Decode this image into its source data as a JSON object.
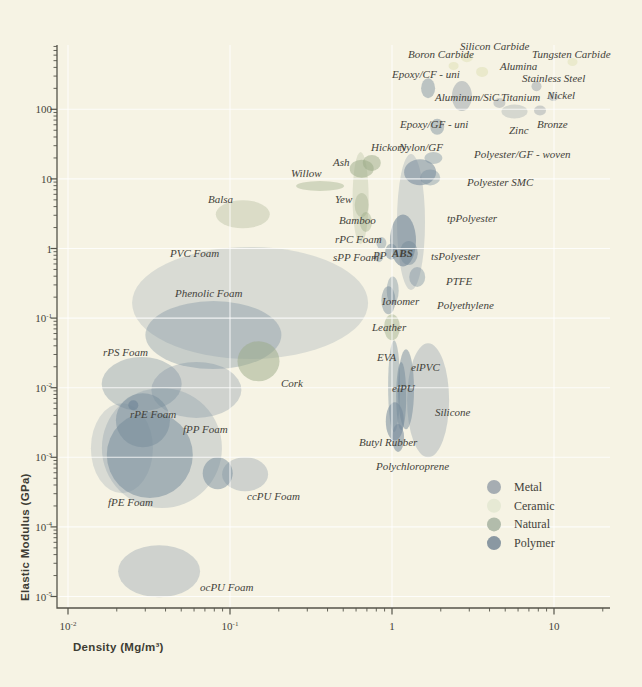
{
  "chart_data": {
    "type": "scatter",
    "subtype": "ashby-bubble-chart",
    "title": "",
    "xlabel": "Density (Mg/m³)",
    "ylabel": "Elastic Modulus (GPa)",
    "x_ticks": [
      0.01,
      0.1,
      1,
      10
    ],
    "y_ticks": [
      100,
      10,
      1,
      0.1,
      0.01,
      0.001,
      0.0001,
      1e-05
    ],
    "xlim": [
      0.0085,
      22
    ],
    "ylim": [
      6.8e-06,
      850
    ],
    "x_scale": "log",
    "y_scale": "log",
    "grid": "white lines at each decade",
    "background": "#f6f3e4",
    "axis_color": "#55544a",
    "categories": {
      "metal": {
        "bubble": "#98a2a9",
        "legend": "#a6adb2"
      },
      "ceramic": {
        "bubble": "#dde0b2",
        "legend": "#e6e9d4"
      },
      "natural": {
        "bubble": "#9aaa85",
        "legend": "#b2bcab"
      },
      "polymer": {
        "bubble": "#74899a",
        "legend": "#8a98a2"
      }
    },
    "legend": {
      "position": "lower right",
      "items": [
        {
          "label": "Metal",
          "cat": "metal"
        },
        {
          "label": "Ceramic",
          "cat": "ceramic"
        },
        {
          "label": "Natural",
          "cat": "natural"
        },
        {
          "label": "Polymer",
          "cat": "polymer"
        }
      ]
    },
    "materials": [
      {
        "label": "Boron Carbide",
        "cat": "ceramic",
        "d": 2.4,
        "E": 420,
        "rx": 5,
        "ry": 4,
        "a": 0.5,
        "lx": 408,
        "ly": 58
      },
      {
        "label": "Silicon Carbide",
        "cat": "ceramic",
        "d": 2.9,
        "E": 560,
        "rx": 6,
        "ry": 5,
        "a": 0.45,
        "lx": 460,
        "ly": 50
      },
      {
        "label": "Tungsten Carbide",
        "cat": "ceramic",
        "d": 13,
        "E": 480,
        "rx": 5,
        "ry": 4,
        "a": 0.45,
        "lx": 532,
        "ly": 58
      },
      {
        "label": "Alumina",
        "cat": "ceramic",
        "d": 3.6,
        "E": 345,
        "rx": 6,
        "ry": 5,
        "a": 0.5,
        "lx": 500,
        "ly": 70
      },
      {
        "label": "Stainless Steel",
        "cat": "metal",
        "d": 7.8,
        "E": 215,
        "rx": 5,
        "ry": 5,
        "a": 0.5,
        "lx": 522,
        "ly": 82
      },
      {
        "label": "Titanium",
        "cat": "metal",
        "d": 4.6,
        "E": 123,
        "rx": 6,
        "ry": 5,
        "a": 0.45,
        "lx": 501,
        "ly": 101
      },
      {
        "label": "Nickel",
        "cat": "metal",
        "d": 9.9,
        "E": 150,
        "rx": 5,
        "ry": 4,
        "a": 0.5,
        "lx": 547,
        "ly": 99
      },
      {
        "label": "Zinc",
        "cat": "metal",
        "d": 5.7,
        "E": 93,
        "rx": 13,
        "ry": 7,
        "a": 0.35,
        "lx": 509,
        "ly": 134
      },
      {
        "label": "Bronze",
        "cat": "metal",
        "d": 8.2,
        "E": 96,
        "rx": 6,
        "ry": 5,
        "a": 0.45,
        "lx": 537,
        "ly": 128
      },
      {
        "label": "Aluminum/SiC",
        "cat": "metal",
        "d": 2.7,
        "E": 155,
        "rx": 10,
        "ry": 15,
        "a": 0.5,
        "lx": 435,
        "ly": 101
      },
      {
        "label": "Epoxy/CF - uni",
        "cat": "polymer",
        "d": 1.67,
        "E": 200,
        "rx": 7,
        "ry": 10,
        "a": 0.45,
        "lx": 392,
        "ly": 78
      },
      {
        "label": "Epoxy/GF - uni",
        "cat": "polymer",
        "d": 1.9,
        "E": 56,
        "rx": 7,
        "ry": 8,
        "a": 0.45,
        "lx": 400,
        "ly": 128
      },
      {
        "label": "Polyester/GF - woven",
        "cat": "polymer",
        "d": 1.8,
        "E": 20,
        "rx": 9,
        "ry": 6,
        "a": 0.4,
        "lx": 474,
        "ly": 158
      },
      {
        "label": "Polyester SMC",
        "cat": "polymer",
        "d": 1.72,
        "E": 10.5,
        "rx": 10,
        "ry": 8,
        "a": 0.4,
        "lx": 467,
        "ly": 186
      },
      {
        "label": "Nylon/GF",
        "cat": "polymer",
        "d": 1.49,
        "E": 12.5,
        "rx": 16,
        "ry": 13,
        "a": 0.55,
        "lx": 399,
        "ly": 151
      },
      {
        "label": "Hickory",
        "cat": "natural",
        "d": 0.75,
        "E": 17,
        "rx": 9,
        "ry": 8,
        "a": 0.5,
        "lx": 371,
        "ly": 151
      },
      {
        "label": "Ash",
        "cat": "natural",
        "d": 0.65,
        "E": 14,
        "rx": 12,
        "ry": 9,
        "a": 0.5,
        "lx": 333,
        "ly": 166
      },
      {
        "label": "Willow",
        "cat": "natural",
        "d": 0.36,
        "E": 7.9,
        "rx": 24,
        "ry": 5,
        "a": 0.4,
        "lx": 291,
        "ly": 177
      },
      {
        "label": "",
        "cat": "natural",
        "d": 0.64,
        "E": 5.3,
        "rx": 8,
        "ry": 46,
        "a": 0.25,
        "lx": 0,
        "ly": 0
      },
      {
        "label": "Yew",
        "cat": "natural",
        "d": 0.65,
        "E": 4.2,
        "rx": 7,
        "ry": 12,
        "a": 0.35,
        "lx": 335,
        "ly": 203
      },
      {
        "label": "Bamboo",
        "cat": "natural",
        "d": 0.69,
        "E": 2.4,
        "rx": 6,
        "ry": 10,
        "a": 0.4,
        "lx": 339,
        "ly": 224
      },
      {
        "label": "Balsa",
        "cat": "natural",
        "d": 0.12,
        "E": 3.1,
        "rx": 27,
        "ry": 14,
        "a": 0.3,
        "lx": 208,
        "ly": 203
      },
      {
        "label": "Cork",
        "cat": "natural",
        "d": 0.15,
        "E": 0.024,
        "rx": 21,
        "ry": 20,
        "a": 0.5,
        "lx": 281,
        "ly": 387
      },
      {
        "label": "Leather",
        "cat": "natural",
        "d": 1.0,
        "E": 0.074,
        "rx": 8,
        "ry": 13,
        "a": 0.45,
        "lx": 372,
        "ly": 331
      },
      {
        "label": "rPC Foam",
        "cat": "polymer",
        "d": 0.86,
        "E": 1.2,
        "rx": 5,
        "ry": 6,
        "a": 0.4,
        "lx": 335,
        "ly": 243
      },
      {
        "label": "sPP Foam",
        "cat": "polymer",
        "d": 0.83,
        "E": 0.75,
        "rx": 4,
        "ry": 5,
        "a": 0.4,
        "lx": 333,
        "ly": 261
      },
      {
        "label": "PP",
        "cat": "polymer",
        "d": 0.99,
        "E": 0.9,
        "rx": 6,
        "ry": 8,
        "a": 0.5,
        "lx": 373,
        "ly": 259
      },
      {
        "label": "ABS",
        "cat": "polymer",
        "d": 1.17,
        "E": 1.3,
        "rx": 13,
        "ry": 26,
        "a": 0.6,
        "lx": 392,
        "ly": 257,
        "bold": true
      },
      {
        "label": "tpPolyester",
        "cat": "polymer",
        "d": 1.31,
        "E": 2.4,
        "rx": 14,
        "ry": 68,
        "a": 0.25,
        "lx": 447,
        "ly": 222
      },
      {
        "label": "tsPolyester",
        "cat": "polymer",
        "d": 1.27,
        "E": 0.86,
        "rx": 9,
        "ry": 12,
        "a": 0.45,
        "lx": 431,
        "ly": 260
      },
      {
        "label": "PTFE",
        "cat": "polymer",
        "d": 1.43,
        "E": 0.39,
        "rx": 8,
        "ry": 10,
        "a": 0.4,
        "lx": 446,
        "ly": 285
      },
      {
        "label": "Polyethylene",
        "cat": "polymer",
        "d": 1.01,
        "E": 0.25,
        "rx": 6,
        "ry": 14,
        "a": 0.4,
        "lx": 437,
        "ly": 309
      },
      {
        "label": "Ionomer",
        "cat": "polymer",
        "d": 0.95,
        "E": 0.18,
        "rx": 7,
        "ry": 14,
        "a": 0.45,
        "lx": 382,
        "ly": 305
      },
      {
        "label": "EVA",
        "cat": "polymer",
        "d": 1.03,
        "E": 0.0105,
        "rx": 6,
        "ry": 46,
        "a": 0.4,
        "lx": 377,
        "ly": 361
      },
      {
        "label": "elPVC",
        "cat": "polymer",
        "d": 1.22,
        "E": 0.0095,
        "rx": 8,
        "ry": 40,
        "a": 0.5,
        "lx": 411,
        "ly": 371
      },
      {
        "label": "elPU",
        "cat": "polymer",
        "d": 1.14,
        "E": 0.0076,
        "rx": 5,
        "ry": 34,
        "a": 0.5,
        "lx": 392,
        "ly": 392
      },
      {
        "label": "Silicone",
        "cat": "polymer",
        "d": 1.67,
        "E": 0.0066,
        "rx": 21,
        "ry": 57,
        "a": 0.3,
        "lx": 435,
        "ly": 416
      },
      {
        "label": "Butyl Rubber",
        "cat": "polymer",
        "d": 1.04,
        "E": 0.0033,
        "rx": 9,
        "ry": 19,
        "a": 0.55,
        "lx": 359,
        "ly": 446
      },
      {
        "label": "Polychloroprene",
        "cat": "polymer",
        "d": 1.09,
        "E": 0.0019,
        "rx": 6,
        "ry": 14,
        "a": 0.55,
        "lx": 376,
        "ly": 470
      },
      {
        "label": "PVC Foam",
        "cat": "polymer",
        "d": 0.133,
        "E": 0.165,
        "rx": 118,
        "ry": 56,
        "a": 0.22,
        "lx": 170,
        "ly": 257
      },
      {
        "label": "Phenolic Foam",
        "cat": "polymer",
        "d": 0.079,
        "E": 0.057,
        "rx": 68,
        "ry": 34,
        "a": 0.35,
        "lx": 175,
        "ly": 297
      },
      {
        "label": "rPS Foam",
        "cat": "polymer",
        "d": 0.0285,
        "E": 0.0113,
        "rx": 40,
        "ry": 27,
        "a": 0.35,
        "lx": 103,
        "ly": 356
      },
      {
        "label": "",
        "cat": "polymer",
        "d": 0.062,
        "E": 0.0093,
        "rx": 45,
        "ry": 28,
        "a": 0.3,
        "lx": 0,
        "ly": 0
      },
      {
        "label": "rPE Foam",
        "cat": "polymer",
        "d": 0.029,
        "E": 0.0034,
        "rx": 27,
        "ry": 27,
        "a": 0.45,
        "lx": 130,
        "ly": 418
      },
      {
        "label": "",
        "cat": "polymer",
        "d": 0.0253,
        "E": 0.0056,
        "rx": 5,
        "ry": 5,
        "a": 0.7,
        "lx": 0,
        "ly": 0
      },
      {
        "label": "fPE Foam",
        "cat": "polymer",
        "d": 0.032,
        "E": 0.00108,
        "rx": 43,
        "ry": 43,
        "a": 0.5,
        "lx": 108,
        "ly": 506
      },
      {
        "label": "fPP Foam",
        "cat": "polymer",
        "d": 0.038,
        "E": 0.00136,
        "rx": 60,
        "ry": 60,
        "a": 0.25,
        "lx": 183,
        "ly": 433
      },
      {
        "label": "",
        "cat": "polymer",
        "d": 0.0215,
        "E": 0.00135,
        "rx": 31,
        "ry": 45,
        "a": 0.22,
        "lx": 0,
        "ly": 0
      },
      {
        "label": "ccPU Foam",
        "cat": "polymer",
        "d": 0.084,
        "E": 0.00059,
        "rx": 15,
        "ry": 16,
        "a": 0.5,
        "lx": 247,
        "ly": 500
      },
      {
        "label": "",
        "cat": "polymer",
        "d": 0.124,
        "E": 0.00057,
        "rx": 23,
        "ry": 17,
        "a": 0.3,
        "lx": 0,
        "ly": 0
      },
      {
        "label": "ocPU Foam",
        "cat": "polymer",
        "d": 0.0365,
        "E": 2.3e-05,
        "rx": 41,
        "ry": 26,
        "a": 0.3,
        "lx": 200,
        "ly": 591
      }
    ]
  }
}
